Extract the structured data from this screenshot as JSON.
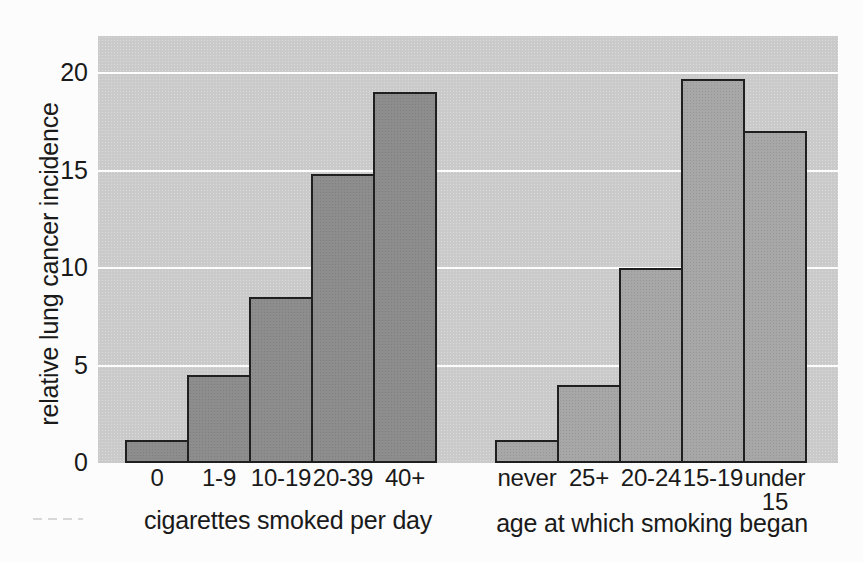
{
  "chart_data": {
    "type": "bar",
    "title": "",
    "ylabel": "relative lung cancer incidence",
    "ylim": [
      0,
      21.9
    ],
    "yticks": [
      0,
      5,
      10,
      15,
      20
    ],
    "gridlines": [
      5,
      10,
      15,
      20
    ],
    "legend": "none",
    "plot_bg_color": "#cacaca",
    "gridline_color": "#ffffff",
    "bar_border_color": "#1f1f1f",
    "text_color": "#1a1a1a",
    "groups": [
      {
        "name": "cigarettes-per-day",
        "xlabel": "cigarettes smoked per day",
        "bar_color": "#8d8d8d",
        "categories": [
          "0",
          "1-9",
          "10-19",
          "20-39",
          "40+"
        ],
        "values": [
          1.2,
          4.5,
          8.5,
          14.8,
          19
        ]
      },
      {
        "name": "age-smoking-began",
        "xlabel": "age at which smoking began",
        "bar_color": "#a7a7a7",
        "categories": [
          "never",
          "25+",
          "20-24",
          "15-19",
          "under\n15"
        ],
        "values": [
          1.2,
          4,
          10,
          19.7,
          17
        ]
      }
    ]
  }
}
